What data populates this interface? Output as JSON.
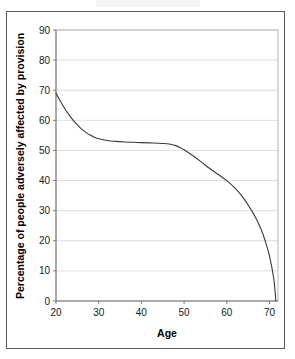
{
  "chart_data": {
    "type": "line",
    "title": "",
    "xlabel": "Age",
    "ylabel": "Percentage of people adversely affected by provision",
    "xlim": [
      20,
      72
    ],
    "ylim": [
      0,
      90
    ],
    "grid": true,
    "legend": "none",
    "x_ticks": [
      20,
      30,
      40,
      50,
      60,
      70
    ],
    "x_tick_labels": [
      "20",
      "30",
      "40",
      "50",
      "60",
      "70"
    ],
    "y_ticks": [
      0,
      10,
      20,
      30,
      40,
      50,
      60,
      70,
      80,
      90
    ],
    "y_tick_labels": [
      "0",
      "10",
      "20",
      "30",
      "40",
      "50",
      "60",
      "70",
      "80",
      "90"
    ],
    "series": [
      {
        "name": "Percentage adversely affected",
        "color": "#3a3a3a",
        "x": [
          20,
          21,
          22,
          23,
          24,
          25,
          26,
          27,
          28,
          29,
          30,
          32,
          34,
          36,
          38,
          40,
          42,
          44,
          46,
          47,
          48,
          49,
          50,
          52,
          54,
          56,
          58,
          60,
          62,
          64,
          66,
          67,
          68,
          69,
          70,
          71,
          71.5
        ],
        "y": [
          69.0,
          66.4,
          64.0,
          61.9,
          60.1,
          58.5,
          57.1,
          56.0,
          55.1,
          54.4,
          53.9,
          53.3,
          53.0,
          52.8,
          52.7,
          52.6,
          52.5,
          52.4,
          52.2,
          52.0,
          51.6,
          51.0,
          50.2,
          48.3,
          46.2,
          44.0,
          42.0,
          40.0,
          37.4,
          34.0,
          29.6,
          27.0,
          24.0,
          20.0,
          15.0,
          7.5,
          0.0
        ]
      }
    ]
  },
  "figure": {
    "y_axis_title": "Percentage of people adversely affected by provision",
    "x_axis_title": "Age"
  }
}
